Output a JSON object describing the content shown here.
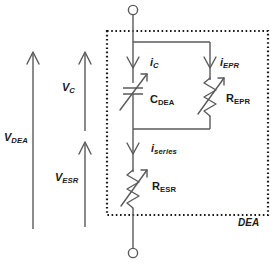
{
  "figure": {
    "kind": "electrical-circuit-schematic",
    "stroke_color": "#5a5a5a",
    "text_color": "#1a1a1a",
    "background": "#ffffff",
    "box_border_color": "#1a1a1a",
    "box_border_style": "dotted"
  },
  "enclosure": {
    "label": "DEA",
    "style": "dotted-rectangle"
  },
  "terminals": [
    {
      "name": "top-terminal",
      "symbol": "open-circle"
    },
    {
      "name": "bottom-terminal",
      "symbol": "open-circle"
    }
  ],
  "components": [
    {
      "id": "c-dea",
      "symbol": "variable-capacitor",
      "label_base": "C",
      "label_sub": "DEA"
    },
    {
      "id": "r-epr",
      "symbol": "variable-resistor",
      "label_base": "R",
      "label_sub": "EPR"
    },
    {
      "id": "r-esr",
      "symbol": "variable-resistor",
      "label_base": "R",
      "label_sub": "ESR"
    }
  ],
  "currents": [
    {
      "id": "i-c",
      "label_base": "i",
      "label_sub": "C",
      "direction": "down"
    },
    {
      "id": "i-epr",
      "label_base": "i",
      "label_sub": "EPR",
      "direction": "down"
    },
    {
      "id": "i-series",
      "label_base": "i",
      "label_sub": "series",
      "direction": "down"
    }
  ],
  "voltages": [
    {
      "id": "v-dea",
      "label_base": "V",
      "label_sub": "DEA",
      "direction": "up",
      "span": "full"
    },
    {
      "id": "v-c",
      "label_base": "V",
      "label_sub": "C",
      "direction": "up",
      "span": "upper"
    },
    {
      "id": "v-esr",
      "label_base": "V",
      "label_sub": "ESR",
      "direction": "up",
      "span": "lower"
    }
  ]
}
